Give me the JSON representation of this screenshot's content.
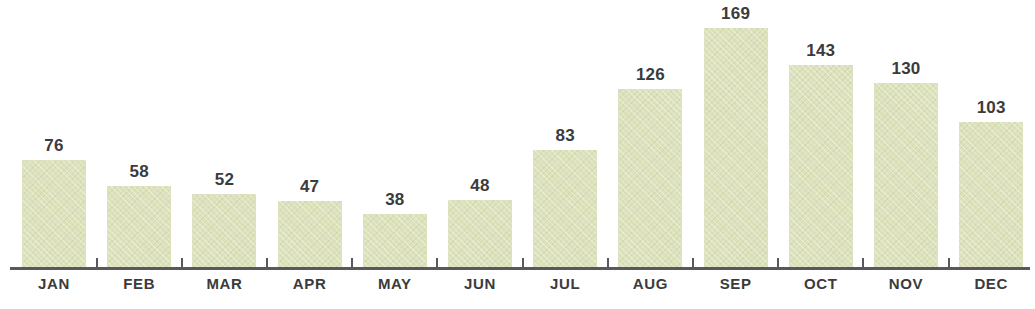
{
  "chart_data": {
    "type": "bar",
    "title": "",
    "subtitle": "",
    "xlabel": "",
    "ylabel": "",
    "categories": [
      "JAN",
      "FEB",
      "MAR",
      "APR",
      "MAY",
      "JUN",
      "JUL",
      "AUG",
      "SEP",
      "OCT",
      "NOV",
      "DEC"
    ],
    "values": [
      76,
      58,
      52,
      47,
      38,
      48,
      83,
      126,
      169,
      143,
      130,
      103
    ],
    "value_labels": [
      "76",
      "58",
      "52",
      "47",
      "38",
      "48",
      "83",
      "126",
      "169",
      "143",
      "130",
      "103"
    ],
    "ylim": [
      0,
      169
    ],
    "grid": false,
    "legend": false,
    "legend_position": "none",
    "axis_visible": {
      "x": true,
      "y": false
    },
    "bar_color": "#dde2bc",
    "axis_color": "#58595b",
    "label_color": "#3b3b3b",
    "background_color": "#ffffff",
    "data_labels_shown": true,
    "tick_count": 11
  },
  "axis": {
    "x_axis_name": "x-axis-line"
  }
}
